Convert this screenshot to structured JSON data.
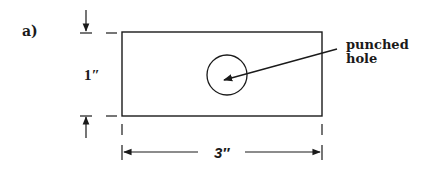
{
  "figure": {
    "panel_label": "a)",
    "height_dimension": "1″",
    "width_dimension": "3″",
    "callout": {
      "line1": "punched",
      "line2": "hole"
    }
  },
  "colors": {
    "stroke": "#1a1a1a",
    "background": "#ffffff"
  }
}
